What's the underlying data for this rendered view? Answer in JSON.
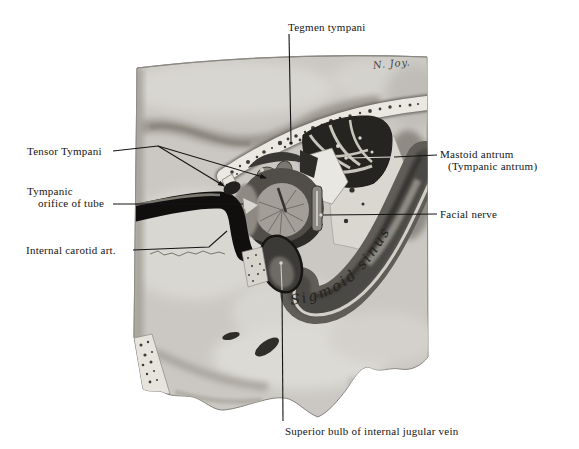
{
  "figure": {
    "signature": "N. Joy.",
    "labels": {
      "tegmen_tympani": "Tegmen tympani",
      "tensor_tympani": "Tensor Tympani",
      "tympanic_orifice_line1": "Tympanic",
      "tympanic_orifice_line2": "orifice of tube",
      "internal_carotid": "Internal carotid art.",
      "mastoid_antrum_line1": "Mastoid antrum",
      "mastoid_antrum_line2": "(Tympanic antrum)",
      "facial_nerve": "Facial nerve",
      "sigmoid_sinus": "Sigmoid sinus",
      "superior_bulb": "Superior bulb of internal jugular vein"
    },
    "colors": {
      "page_bg": "#ffffff",
      "plate_base": "#cbc8c3",
      "ink": "#141414",
      "artery_black": "#100f0e",
      "sinus_gray": "#5e5b56"
    }
  }
}
